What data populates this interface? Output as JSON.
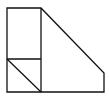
{
  "diagram": {
    "type": "geometry-figure",
    "stroke_color": "#111111",
    "background": "#ffffff",
    "shapes": [
      {
        "name": "outer-polygon",
        "points": [
          [
            7,
            8
          ],
          [
            41,
            8
          ],
          [
            104,
            73
          ],
          [
            104,
            92
          ],
          [
            7,
            92
          ]
        ]
      },
      {
        "name": "vertical-divider",
        "from": [
          41,
          8
        ],
        "to": [
          41,
          92
        ]
      },
      {
        "name": "horizontal-divider",
        "from": [
          7,
          59
        ],
        "to": [
          41,
          59
        ]
      },
      {
        "name": "diagonal-small",
        "from": [
          7,
          59
        ],
        "to": [
          41,
          92
        ]
      }
    ]
  }
}
